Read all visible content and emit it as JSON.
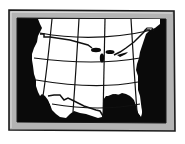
{
  "illustration": {
    "subject": "Framed map of the United States with latitude/longitude grid",
    "style": "black-and-white clip art"
  },
  "colors": {
    "background": "#ffffff",
    "frame_fill": "#b4b4b4",
    "frame_outline": "#1a1a1a",
    "water": "#0a0a0a",
    "land": "#ffffff",
    "grid_lines": "#111111"
  },
  "map": {
    "region": "Continental United States",
    "features": [
      "Great Lakes",
      "Florida peninsula",
      "Gulf of Mexico",
      "Baja California",
      "US-Mexico border",
      "US-Canada border"
    ],
    "grid": {
      "meridians": 4,
      "parallels": 4
    }
  }
}
